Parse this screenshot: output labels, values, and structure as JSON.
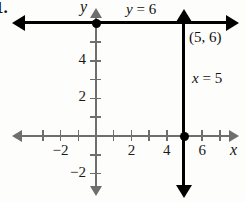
{
  "figure": {
    "problem_number": "1.",
    "type": "coordinate-graph"
  },
  "axes": {
    "x_axis_label": "x",
    "y_axis_label": "y",
    "x_ticks": [
      {
        "value": -3,
        "label": ""
      },
      {
        "value": -2,
        "label": "−2"
      },
      {
        "value": -1,
        "label": ""
      },
      {
        "value": 1,
        "label": ""
      },
      {
        "value": 2,
        "label": "2"
      },
      {
        "value": 3,
        "label": ""
      },
      {
        "value": 4,
        "label": "4"
      },
      {
        "value": 6,
        "label": "6"
      },
      {
        "value": 7,
        "label": ""
      }
    ],
    "y_ticks": [
      {
        "value": 5,
        "label": ""
      },
      {
        "value": 4,
        "label": "4"
      },
      {
        "value": 3,
        "label": ""
      },
      {
        "value": 2,
        "label": "2"
      },
      {
        "value": 1,
        "label": ""
      },
      {
        "value": -1,
        "label": ""
      },
      {
        "value": -2,
        "label": "−2"
      }
    ],
    "xlim": [
      -4.3,
      7.7
    ],
    "ylim": [
      -2.8,
      6.4
    ],
    "grid": false,
    "origin_label": ""
  },
  "chart_data": {
    "type": "line",
    "title": "",
    "xlabel": "x",
    "ylabel": "y",
    "xlim": [
      -4.3,
      7.7
    ],
    "ylim": [
      -2.8,
      6.4
    ],
    "grid": false,
    "series": [
      {
        "name": "y = 6",
        "equation": "y = 6",
        "orientation": "horizontal",
        "constant": 6,
        "x": [
          -4.3,
          7.7
        ],
        "values": [
          6,
          6
        ],
        "arrows": "both"
      },
      {
        "name": "x = 5",
        "equation": "x = 5",
        "orientation": "vertical",
        "constant": 5,
        "x": [
          5,
          5
        ],
        "values": [
          -2.8,
          6.4
        ],
        "arrows": "both"
      }
    ],
    "points": [
      {
        "x": 0,
        "y": 6,
        "label": ""
      },
      {
        "x": 5,
        "y": 0,
        "label": ""
      }
    ],
    "annotations": [
      {
        "text": "y = 6",
        "x": 1.8,
        "y": 6.6
      },
      {
        "text": "(5, 6)",
        "x": 5.3,
        "y": 5.3
      },
      {
        "text": "x = 5",
        "x": 5.5,
        "y": 3.2
      }
    ]
  },
  "labels": {
    "line_horizontal": {
      "var": "y",
      "rest": " = 6"
    },
    "line_vertical": {
      "var": "x",
      "rest": " = 5"
    },
    "intersection_point": "(5, 6)"
  },
  "colors": {
    "background": "#fdfdfc",
    "axis": "#6e6e6e",
    "graph_line": "#000000",
    "text": "#111111"
  }
}
